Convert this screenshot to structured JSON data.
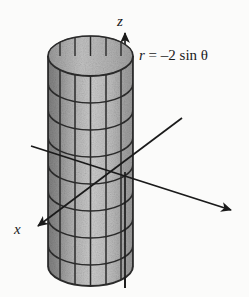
{
  "figure": {
    "kind": "3d-surface-diagram",
    "background_color": "#fbfbfa",
    "ink_color": "#1a1a1a"
  },
  "axes": {
    "z": {
      "label": "z",
      "direction": "up",
      "arrow": true
    },
    "x": {
      "label": "x",
      "direction": "down-left",
      "arrow": true
    },
    "y": {
      "label": "",
      "direction": "down-right",
      "arrow": true
    }
  },
  "annotation": {
    "equation_var": "r",
    "equation_eq": " = –2 ",
    "equation_fn": "sin",
    "equation_theta": " θ",
    "equation_full": "r = –2 sin θ"
  },
  "surface": {
    "name": "cylinder",
    "shading": "gray-speckled",
    "mesh": "grid",
    "vertical_lines": 7,
    "horizontal_rings": 8,
    "fill_light": "#c9c9c9",
    "fill_dark": "#8e8e8e",
    "mesh_color": "#2a2a2a"
  }
}
